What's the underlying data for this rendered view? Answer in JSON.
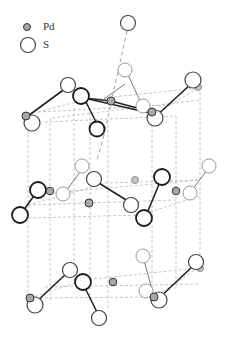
{
  "figure": {
    "legend": {
      "items": [
        {
          "symbol": "small-gray-circle",
          "label": "Pd",
          "color": "#a8a8a8"
        },
        {
          "symbol": "large-open-circle",
          "label": "S",
          "color": "#ffffff"
        }
      ]
    },
    "colors": {
      "pd_fill": "#a8a8a8",
      "s_fill": "#ffffff",
      "bond": "#222222",
      "cell_edge": "#b8b8b8"
    }
  }
}
